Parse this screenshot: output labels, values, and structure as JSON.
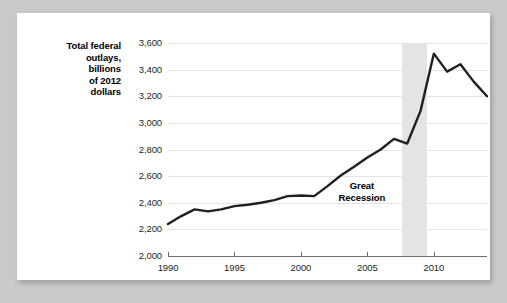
{
  "figure": {
    "background_color": "#c9c9c9",
    "card_color": "#ffffff"
  },
  "chart_data": {
    "type": "line",
    "title": "",
    "subtitle": "",
    "xlabel": "",
    "ylabel": "Total federal outlays, billions of 2012 dollars",
    "ylabel_lines": [
      "Total federal",
      "outlays,",
      "billions",
      "of 2012",
      "dollars"
    ],
    "xlim": [
      1990,
      2014
    ],
    "ylim": [
      2000,
      3600
    ],
    "grid": true,
    "legend": null,
    "line_color": "#231f20",
    "line_width": 2.4,
    "yticks": [
      2000,
      2200,
      2400,
      2600,
      2800,
      3000,
      3200,
      3400,
      3600
    ],
    "ytick_labels": [
      "2,000",
      "2,200",
      "2,400",
      "2,600",
      "2,800",
      "3,000",
      "3,200",
      "3,400",
      "3,600"
    ],
    "xticks": [
      1990,
      1995,
      2000,
      2005,
      2010
    ],
    "xtick_labels": [
      "1990",
      "1995",
      "2000",
      "2005",
      "2010"
    ],
    "x": [
      1990,
      1991,
      1992,
      1993,
      1994,
      1995,
      1996,
      1997,
      1998,
      1999,
      2000,
      2001,
      2002,
      2003,
      2004,
      2005,
      2006,
      2007,
      2008,
      2009,
      2010,
      2011,
      2012,
      2013,
      2014
    ],
    "values": [
      2240,
      2300,
      2350,
      2335,
      2350,
      2375,
      2385,
      2400,
      2420,
      2450,
      2455,
      2450,
      2525,
      2605,
      2670,
      2740,
      2800,
      2880,
      2845,
      3090,
      3520,
      3385,
      3440,
      3310,
      3200
    ],
    "series": [
      {
        "name": "Total federal outlays",
        "values": [
          2240,
          2300,
          2350,
          2335,
          2350,
          2375,
          2385,
          2400,
          2420,
          2450,
          2455,
          2450,
          2525,
          2605,
          2670,
          2740,
          2800,
          2880,
          2845,
          3090,
          3520,
          3385,
          3440,
          3310,
          3200
        ]
      }
    ],
    "annotations": [
      {
        "name": "great-recession",
        "label": "Great Recession",
        "label_lines": [
          "Great",
          "Recession"
        ],
        "shaded_band": {
          "x_start": 2007.6,
          "x_end": 2009.5,
          "color": "#e4e4e4"
        }
      }
    ]
  }
}
